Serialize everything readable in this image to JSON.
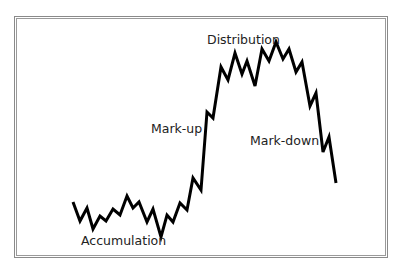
{
  "chart_data": {
    "type": "line",
    "title": "",
    "xlabel": "",
    "ylabel": "",
    "grid": false,
    "legend": null,
    "annotations": [
      {
        "text": "Accumulation",
        "x": 81,
        "y": 245
      },
      {
        "text": "Mark-up",
        "x": 151,
        "y": 133
      },
      {
        "text": "Distribution",
        "x": 207,
        "y": 44
      },
      {
        "text": "Mark-down",
        "x": 250,
        "y": 145
      }
    ],
    "points_px": [
      [
        73,
        202
      ],
      [
        80,
        221
      ],
      [
        87,
        208
      ],
      [
        93,
        229
      ],
      [
        100,
        216
      ],
      [
        106,
        221
      ],
      [
        113,
        209
      ],
      [
        120,
        215
      ],
      [
        127,
        196
      ],
      [
        133,
        208
      ],
      [
        139,
        202
      ],
      [
        147,
        222
      ],
      [
        153,
        209
      ],
      [
        161,
        237
      ],
      [
        167,
        215
      ],
      [
        173,
        222
      ],
      [
        180,
        203
      ],
      [
        187,
        210
      ],
      [
        193,
        178
      ],
      [
        201,
        190
      ],
      [
        207,
        112
      ],
      [
        213,
        118
      ],
      [
        221,
        67
      ],
      [
        228,
        80
      ],
      [
        235,
        53
      ],
      [
        242,
        74
      ],
      [
        247,
        61
      ],
      [
        255,
        86
      ],
      [
        262,
        49
      ],
      [
        269,
        61
      ],
      [
        276,
        42
      ],
      [
        283,
        59
      ],
      [
        289,
        49
      ],
      [
        296,
        72
      ],
      [
        302,
        62
      ],
      [
        310,
        106
      ],
      [
        316,
        93
      ],
      [
        323,
        152
      ],
      [
        329,
        137
      ],
      [
        336,
        183
      ]
    ],
    "line_color": "#000000",
    "line_width": 3
  },
  "labels": {
    "accumulation": "Accumulation",
    "markup": "Mark-up",
    "distribution": "Distribution",
    "markdown": "Mark-down"
  }
}
